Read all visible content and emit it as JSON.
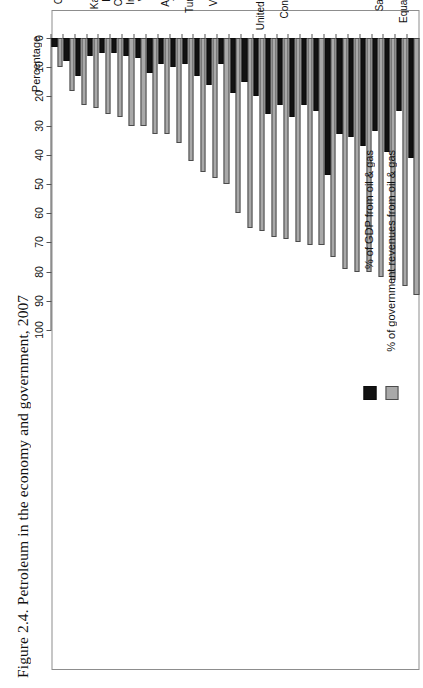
{
  "caption": "Figure 2.4. Petroleum in the economy and government, 2007",
  "legend": {
    "items": [
      {
        "key": "gov",
        "label": "% of government revenues from oil & gas",
        "color": "#a9a9a9",
        "swatch_icon": "legend-swatch-gray"
      },
      {
        "key": "gdp",
        "label": "% of GDP from oil & gas",
        "color": "#121212",
        "swatch_icon": "legend-swatch-black"
      }
    ]
  },
  "axis": {
    "title": "Percentage",
    "ticks": [
      "0",
      "10",
      "20",
      "30",
      "40",
      "50",
      "60",
      "70",
      "80",
      "90",
      "100"
    ],
    "min": 0,
    "max": 100
  },
  "chart_data": {
    "type": "bar",
    "orientation": "horizontal",
    "title": "Petroleum in the economy and government, 2007",
    "xlabel": "Percentage",
    "ylabel": "",
    "xlim": [
      0,
      100
    ],
    "grid": false,
    "legend_position": "top-left",
    "categories": [
      "Brunei",
      "Equatorial Guinea",
      "Oman",
      "Saudi Arabia",
      "Libya",
      "Angola",
      "Nigeria",
      "Kuwait",
      "Yemen",
      "Bahrain",
      "Algeria",
      "Congo Republic",
      "Qatar",
      "United Arab Emirates",
      "Iran",
      "Gabon",
      "Sudan",
      "Venezuela",
      "Syria",
      "Turkmenistan",
      "Trinidad",
      "Azerbaijan",
      "Mexico",
      "Vietnam",
      "Indonesia",
      "Cameroon",
      "Ecuador",
      "Kazakhstan",
      "Norway",
      "Russia",
      "Colombia"
    ],
    "series": [
      {
        "name": "% of government revenues from oil & gas",
        "color": "#a9a9a9",
        "values": [
          88,
          85,
          83,
          82,
          80,
          80,
          79,
          75,
          71,
          71,
          70,
          69,
          68,
          66,
          65,
          60,
          50,
          48,
          46,
          42,
          36,
          33,
          33,
          30,
          30,
          27,
          26,
          24,
          23,
          18,
          10
        ]
      },
      {
        "name": "% of GDP from oil & gas",
        "color": "#121212",
        "values": [
          41,
          25,
          39,
          32,
          37,
          34,
          33,
          47,
          25,
          23,
          27,
          23,
          26,
          20,
          15,
          19,
          9,
          16,
          13,
          9,
          10,
          9,
          12,
          7,
          6,
          5,
          5,
          6,
          13,
          8,
          3
        ]
      }
    ]
  }
}
